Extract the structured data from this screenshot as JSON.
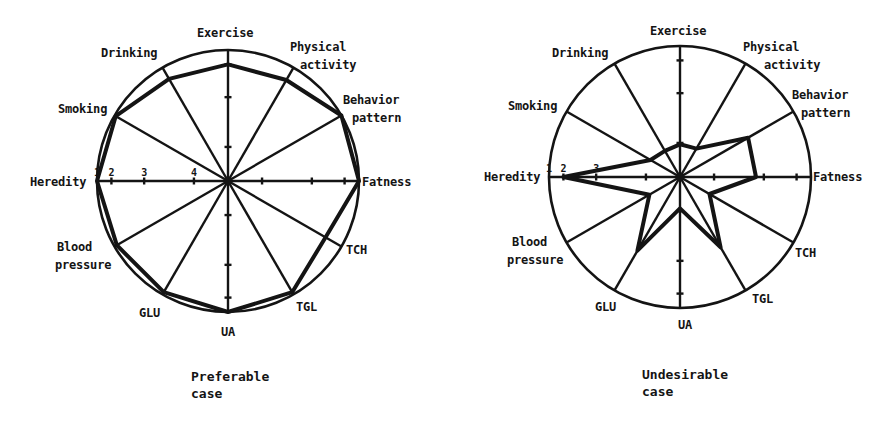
{
  "chart_data": [
    {
      "type": "radar",
      "title": "Preferable case",
      "caption_lines": [
        "Preferable",
        "case"
      ],
      "center": [
        228,
        181
      ],
      "radius": 131,
      "scale": {
        "tick_labels": [
          "1",
          "2",
          "3",
          "4"
        ],
        "tick_radius_fraction": [
          1.0,
          0.89,
          0.64,
          0.26
        ],
        "note": "1 at rim, decreasing toward centre"
      },
      "axes": [
        {
          "name": "Fatness",
          "angle": 0,
          "value": 1.0
        },
        {
          "name": "Behavior pattern",
          "angle": 30,
          "value": 1.0
        },
        {
          "name": "Physical activity",
          "angle": 60,
          "value": 0.89
        },
        {
          "name": "Exercise",
          "angle": 90,
          "value": 0.89
        },
        {
          "name": "Drinking",
          "angle": 120,
          "value": 0.9
        },
        {
          "name": "Smoking",
          "angle": 150,
          "value": 0.99
        },
        {
          "name": "Heredity",
          "angle": 180,
          "value": 1.0
        },
        {
          "name": "Blood pressure",
          "angle": 210,
          "value": 0.98
        },
        {
          "name": "GLU",
          "angle": 240,
          "value": 0.98
        },
        {
          "name": "UA",
          "angle": 270,
          "value": 1.0
        },
        {
          "name": "TGL",
          "angle": 300,
          "value": 0.98
        },
        {
          "name": "TCH",
          "angle": 330,
          "value": 0.86
        }
      ],
      "labels": [
        {
          "lines": [
            "Exercise"
          ],
          "x": 197,
          "y": 37
        },
        {
          "lines": [
            "Physical",
            "activity"
          ],
          "x": 290,
          "y": 51,
          "x2": 300
        },
        {
          "lines": [
            "Behavior",
            "pattern"
          ],
          "x": 343,
          "y": 104,
          "x2": 352
        },
        {
          "lines": [
            "Fatness"
          ],
          "x": 362,
          "y": 186
        },
        {
          "lines": [
            "TCH"
          ],
          "x": 346,
          "y": 254
        },
        {
          "lines": [
            "TGL"
          ],
          "x": 296,
          "y": 311
        },
        {
          "lines": [
            "UA"
          ],
          "x": 221,
          "y": 336
        },
        {
          "lines": [
            "GLU"
          ],
          "x": 139,
          "y": 317
        },
        {
          "lines": [
            "Blood",
            "pressure"
          ],
          "x": 57,
          "y": 251,
          "x2": 55
        },
        {
          "lines": [
            "Heredity"
          ],
          "x": 30,
          "y": 186
        },
        {
          "lines": [
            "Smoking"
          ],
          "x": 58,
          "y": 113
        },
        {
          "lines": [
            "Drinking"
          ],
          "x": 101,
          "y": 57
        }
      ]
    },
    {
      "type": "radar",
      "title": "Undesirable case",
      "caption_lines": [
        "Undesirable",
        "case"
      ],
      "center": [
        680,
        177
      ],
      "radius": 131,
      "scale": {
        "tick_labels": [
          "1",
          "2",
          "3"
        ],
        "tick_radius_fraction": [
          1.0,
          0.89,
          0.64,
          0.26
        ],
        "note": "1 at rim, decreasing toward centre"
      },
      "axes": [
        {
          "name": "Fatness",
          "angle": 0,
          "value": 0.58
        },
        {
          "name": "Behavior pattern",
          "angle": 30,
          "value": 0.6
        },
        {
          "name": "Physical activity",
          "angle": 60,
          "value": 0.25
        },
        {
          "name": "Exercise",
          "angle": 90,
          "value": 0.25
        },
        {
          "name": "Drinking",
          "angle": 120,
          "value": 0.23
        },
        {
          "name": "Smoking",
          "angle": 150,
          "value": 0.26
        },
        {
          "name": "Heredity",
          "angle": 180,
          "value": 0.89
        },
        {
          "name": "Blood pressure",
          "angle": 210,
          "value": 0.27
        },
        {
          "name": "GLU",
          "angle": 240,
          "value": 0.65
        },
        {
          "name": "UA",
          "angle": 270,
          "value": 0.24
        },
        {
          "name": "TGL",
          "angle": 300,
          "value": 0.62
        },
        {
          "name": "TCH",
          "angle": 330,
          "value": 0.26
        }
      ],
      "labels": [
        {
          "lines": [
            "Exercise"
          ],
          "x": 650,
          "y": 35
        },
        {
          "lines": [
            "Physical",
            "activity"
          ],
          "x": 743,
          "y": 51,
          "x2": 764
        },
        {
          "lines": [
            "Behavior",
            "pattern"
          ],
          "x": 792,
          "y": 99,
          "x2": 801
        },
        {
          "lines": [
            "Fatness"
          ],
          "x": 813,
          "y": 181
        },
        {
          "lines": [
            "TCH"
          ],
          "x": 795,
          "y": 257
        },
        {
          "lines": [
            "TGL"
          ],
          "x": 752,
          "y": 303
        },
        {
          "lines": [
            "UA"
          ],
          "x": 678,
          "y": 329
        },
        {
          "lines": [
            "GLU"
          ],
          "x": 595,
          "y": 311
        },
        {
          "lines": [
            "Blood",
            "pressure"
          ],
          "x": 512,
          "y": 246,
          "x2": 507
        },
        {
          "lines": [
            "Heredity"
          ],
          "x": 484,
          "y": 181
        },
        {
          "lines": [
            "Smoking"
          ],
          "x": 508,
          "y": 110
        },
        {
          "lines": [
            "Drinking"
          ],
          "x": 552,
          "y": 57
        }
      ]
    }
  ],
  "captions": {
    "left": {
      "line1": "Preferable",
      "line2": "case"
    },
    "right": {
      "line1": "Undesirable",
      "line2": "case"
    }
  },
  "colors": {
    "ink": "#141414",
    "background": "#ffffff"
  }
}
